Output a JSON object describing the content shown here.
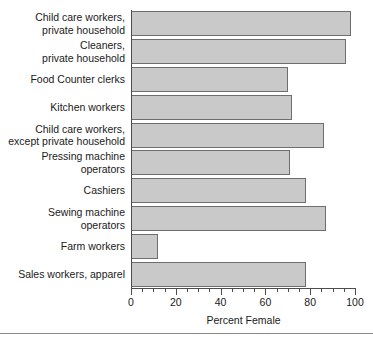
{
  "chart_data": {
    "type": "bar",
    "orientation": "horizontal",
    "title": "",
    "xlabel": "Percent Female",
    "ylabel": "",
    "xlim": [
      0,
      100
    ],
    "xticks": [
      0,
      20,
      40,
      60,
      80,
      100
    ],
    "xtick_labels": [
      "0",
      "20",
      "40",
      "60",
      "80",
      "100"
    ],
    "minor_tick_step": 5,
    "grid": false,
    "legend": null,
    "bar_fill_color": "#c9c9c9",
    "bar_edge_color": "#6e6e6e",
    "axis_color": "#4d4d4d",
    "categories": [
      "Child care workers,\nprivate household",
      "Cleaners,\nprivate household",
      "Food Counter clerks",
      "Kitchen workers",
      "Child care workers,\nexcept private household",
      "Pressing machine\noperators",
      "Cashiers",
      "Sewing machine\noperators",
      "Farm workers",
      "Sales workers, apparel"
    ],
    "values": [
      98,
      96,
      70,
      72,
      86,
      71,
      78,
      87,
      12,
      78
    ]
  }
}
